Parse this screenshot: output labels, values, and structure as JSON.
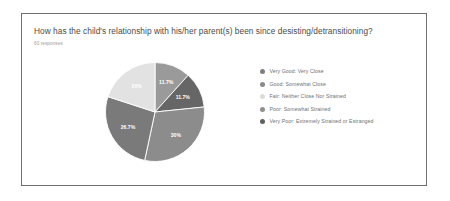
{
  "card": {
    "question": "How has the child's relationship with his/her parent(s) been since desisting/detransitioning?",
    "response_count_label": "60 responses"
  },
  "chart_data": {
    "type": "pie",
    "title": "How has the child's relationship with his/her parent(s) been since desisting/detransitioning?",
    "subtitle": "60 responses",
    "total_responses": 60,
    "legend_position": "right",
    "grid": false,
    "categories": [
      "Very Good: Very Close",
      "Good: Somewhat Close",
      "Fair: Neither Close Nor Strained",
      "Poor: Somewhat Strained",
      "Very Poor: Extremely Strained or Estranged"
    ],
    "values": [
      11.7,
      11.7,
      30,
      26.7,
      20
    ],
    "value_labels": [
      "11.7%",
      "11.7%",
      "30%",
      "26.7%",
      "20%"
    ],
    "colors": [
      "#9a9a9a",
      "#666666",
      "#8c8c8c",
      "#7a7a7a",
      "#e2e2e2"
    ],
    "slices": [
      {
        "label": "Very Good: Very Close",
        "value": 11.7,
        "value_label": "11.7%",
        "color": "#9a9a9a"
      },
      {
        "label": "Good: Somewhat Close",
        "value": 11.7,
        "value_label": "11.7%",
        "color": "#666666"
      },
      {
        "label": "Fair: Neither Close Nor Strained",
        "value": 30,
        "value_label": "30%",
        "color": "#8c8c8c"
      },
      {
        "label": "Poor: Somewhat Strained",
        "value": 26.7,
        "value_label": "26.7%",
        "color": "#7a7a7a"
      },
      {
        "label": "Very Poor: Extremely Strained or Estranged",
        "value": 20,
        "value_label": "20%",
        "color": "#e2e2e2"
      }
    ]
  },
  "legend": {
    "items": [
      {
        "label": "Very Good: Very Close",
        "color": "#7f7f7f"
      },
      {
        "label": "Good: Somewhat Close",
        "color": "#8a8a8a"
      },
      {
        "label": "Fair: Neither Close Nor Strained",
        "color": "#dcdcdc"
      },
      {
        "label": "Poor: Somewhat Strained",
        "color": "#8f8f8f"
      },
      {
        "label": "Very Poor: Extremely Strained or Estranged",
        "color": "#5f5f5f"
      }
    ]
  }
}
